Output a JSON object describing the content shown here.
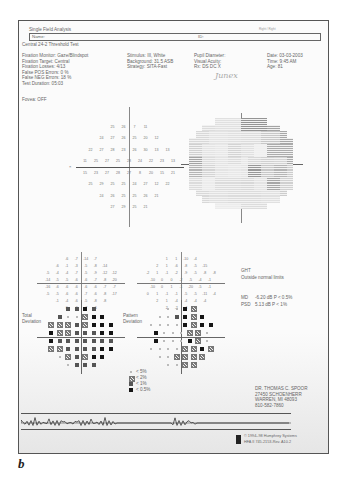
{
  "report": {
    "title": "Single Field Analysis",
    "eye_label": "Right / Right",
    "name_label": "Name:",
    "id_label": "ID:",
    "test_name": "Central 24-2 Threshold Test"
  },
  "params_left": [
    "Fixation Monitor: Gaze/Blindspot",
    "Fixation Target: Central",
    "Fixation Losses: 4/13",
    "False POS Errors: 0 %",
    "False NEG Errors: 18 %",
    "Test Duration: 05:03"
  ],
  "fovea": "Fovea: OFF",
  "params_mid": [
    "Stimulus: III, White",
    "Background: 31.5 ASB",
    "Strategy: SITA-Fast"
  ],
  "params_right1": [
    "Pupil Diameter:",
    "Visual Acuity:",
    "Rx:      DS      DC  X"
  ],
  "params_right2": [
    "Date: 03-03-2003",
    "Time: 9:45 AM",
    "Age: 81"
  ],
  "handwriting": "Junex",
  "threshold_grid": {
    "rows": [
      [
        "25",
        "26",
        "7",
        "11"
      ],
      [
        "24",
        "27",
        "26",
        "25",
        "20",
        "12"
      ],
      [
        "22",
        "27",
        "28",
        "23",
        "26",
        "30",
        "13",
        "13"
      ],
      [
        "11",
        "25",
        "27",
        "25",
        "28",
        "24",
        "22",
        "23",
        "13"
      ],
      [
        "15",
        "23",
        "27",
        "28",
        "27",
        "8",
        "20",
        "15",
        "21"
      ],
      [
        "25",
        "29",
        "25",
        "25",
        "24",
        "27",
        "12",
        "22"
      ],
      [
        "24",
        "26",
        "25",
        "25",
        "26",
        "21"
      ],
      [
        "27",
        "29",
        "25",
        "21"
      ]
    ]
  },
  "total_deviation_values": {
    "rows": [
      [
        "-6",
        "-7",
        "-14",
        "-7"
      ],
      [
        "-6",
        "-1",
        "-3",
        "-5",
        "-8",
        "-14"
      ],
      [
        "-5",
        "-4",
        "-4",
        "-7",
        "-5",
        "-9",
        "-12",
        "-12"
      ],
      [
        "-14",
        "-5",
        "-5",
        "-6",
        "-6",
        "-7",
        "-8",
        "-20"
      ],
      [
        "-16",
        "-6",
        "-6",
        "-6",
        "-6",
        "-6",
        "-7",
        "-7"
      ],
      [
        "-5",
        "-5",
        "-6",
        "-6",
        "-7",
        "-6",
        "-8",
        "-17"
      ],
      [
        "-1",
        "-4",
        "-6",
        "-5",
        "-8",
        "-8"
      ],
      [
        "0",
        "-6",
        "-7",
        "-6"
      ]
    ]
  },
  "pattern_deviation_values": {
    "rows": [
      [
        "1",
        "1",
        "-10",
        "-4"
      ],
      [
        "2",
        "1",
        "-6",
        "-8",
        "-5",
        "-15"
      ],
      [
        "-2",
        "1",
        "-1",
        "-2",
        "-9",
        "-5",
        "-8",
        "-8"
      ],
      [
        "-10",
        "0",
        "0",
        "-2",
        "-5",
        "-4",
        "-1"
      ],
      [
        "-10",
        "0",
        "1",
        "-1",
        "-20",
        "-5",
        "-1"
      ],
      [
        "0",
        "1",
        "-1",
        "-1",
        "-5",
        "-5",
        "-11",
        "-4"
      ],
      [
        "2",
        "1",
        "-4",
        "-4",
        "-4",
        "-4"
      ],
      [
        "2",
        "-2",
        "-4",
        "-5"
      ]
    ]
  },
  "labels": {
    "total_deviation": "Total",
    "total_deviation2": "Deviation",
    "pattern_deviation": "Pattern",
    "pattern_deviation2": "Deviation"
  },
  "ght": {
    "label": "GHT",
    "value": "Outside normal limits"
  },
  "indices": {
    "md_label": "MD",
    "md_value": "-6.20 dB  P < 0.5%",
    "psd_label": "PSD",
    "psd_value": "5.13 dB  P < 1%"
  },
  "legend": [
    {
      "symbol": "dot",
      "label": "< 5%"
    },
    {
      "symbol": "light",
      "label": "< 2%"
    },
    {
      "symbol": "medium",
      "label": "< 1%"
    },
    {
      "symbol": "dark",
      "label": "< 0.5%"
    }
  ],
  "doctor": {
    "name": "DR. THOMAS C. SPOOR",
    "street": "27450 SCHOENHERR",
    "city": "WARREN, MI 48093",
    "phone": "810-582-7860"
  },
  "footer": {
    "copyright": "© 1994–98 Humphrey Systems",
    "model": "HFA II 745-2153-Rev. A10.2"
  },
  "figure_label": "b",
  "axis_label_left": "×"
}
